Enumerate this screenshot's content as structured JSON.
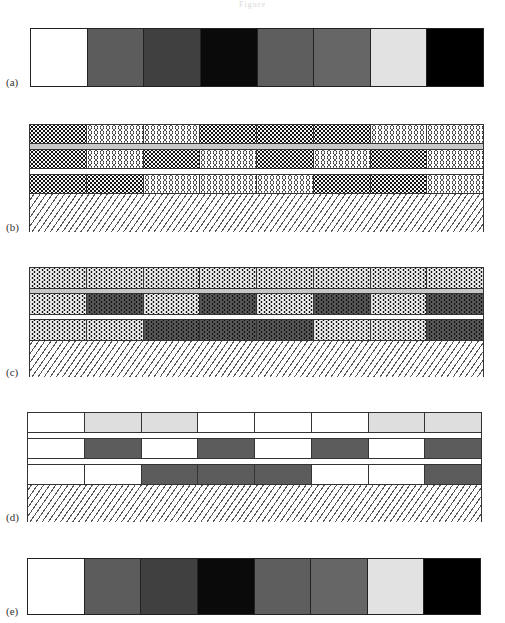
{
  "figure": {
    "title": "Figure"
  },
  "panels": {
    "a": {
      "label": "(a)",
      "swatches": [
        "#ffffff",
        "#5c5c5c",
        "#404040",
        "#0a0a0a",
        "#5e5e5e",
        "#666666",
        "#e2e2e2",
        "#000000"
      ]
    },
    "b": {
      "label": "(b)",
      "legend": {
        "D": "dense dots",
        "O": "open circles"
      },
      "rows": [
        [
          "D",
          "O",
          "O",
          "D",
          "D",
          "D",
          "O",
          "O"
        ],
        [
          "D",
          "O",
          "D",
          "O",
          "D",
          "O",
          "D",
          "O"
        ],
        [
          "D",
          "D",
          "O",
          "O",
          "O",
          "D",
          "D",
          "O"
        ]
      ],
      "separators": [
        "#c8c8c8",
        "#ffffff"
      ],
      "substrate": "hatched"
    },
    "c": {
      "label": "(c)",
      "legend": {
        "L": "light stipple",
        "K": "dark stipple"
      },
      "rows": [
        [
          "L",
          "L",
          "L",
          "L",
          "L",
          "L",
          "L",
          "L"
        ],
        [
          "L",
          "K",
          "L",
          "K",
          "L",
          "K",
          "L",
          "K"
        ],
        [
          "L",
          "L",
          "K",
          "K",
          "K",
          "L",
          "L",
          "K"
        ]
      ],
      "separators": [
        "#c8c8c8",
        "#ffffff"
      ],
      "substrate": "hatched"
    },
    "d": {
      "label": "(d)",
      "legend": {
        "W": "white",
        "G": "light gray",
        "K": "gray"
      },
      "rows": [
        [
          "W",
          "G",
          "G",
          "W",
          "W",
          "W",
          "G",
          "G"
        ],
        [
          "W",
          "K",
          "W",
          "K",
          "W",
          "K",
          "W",
          "K"
        ],
        [
          "W",
          "W",
          "K",
          "K",
          "K",
          "W",
          "W",
          "K"
        ]
      ],
      "separators": [
        "#ffffff",
        "#ffffff"
      ],
      "substrate": "hatched"
    },
    "e": {
      "label": "(e)",
      "swatches": [
        "#ffffff",
        "#5c5c5c",
        "#404040",
        "#0a0a0a",
        "#5e5e5e",
        "#666666",
        "#e2e2e2",
        "#000000"
      ]
    }
  }
}
